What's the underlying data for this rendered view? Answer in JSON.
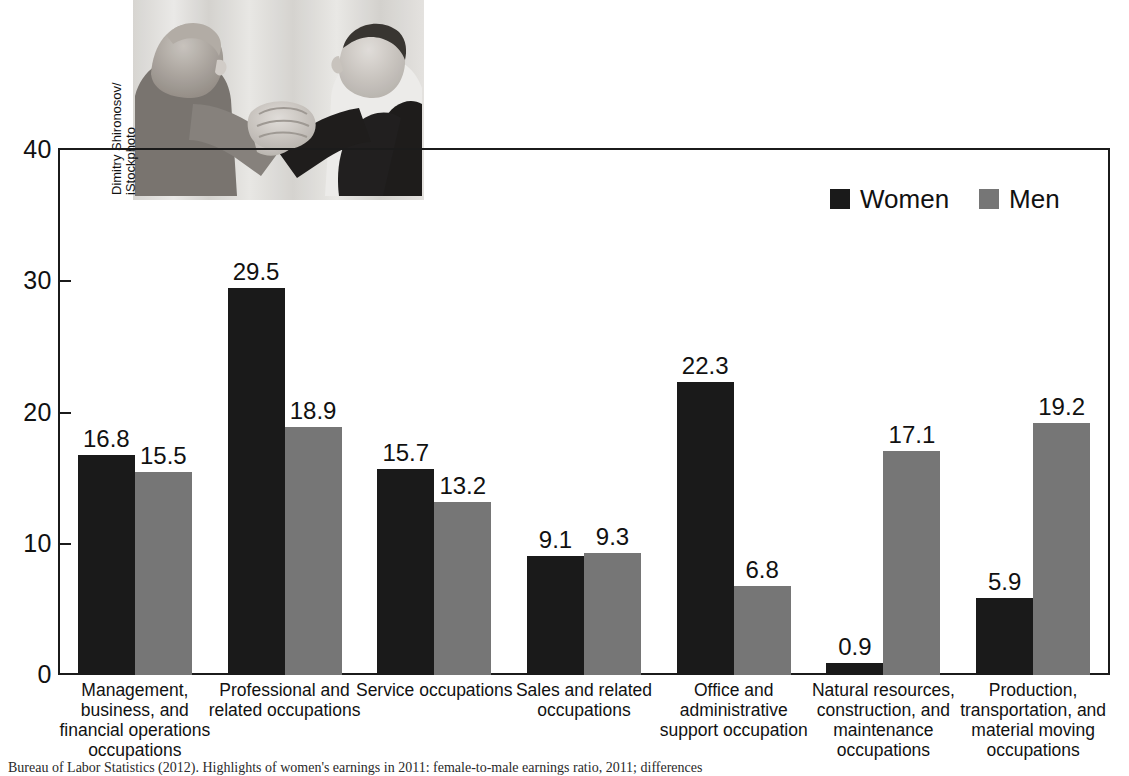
{
  "chart_data": {
    "type": "bar",
    "title": "",
    "subtitle": "",
    "xlabel": "",
    "ylabel": "",
    "ylim": [
      0,
      40
    ],
    "yticks": [
      "0",
      "10",
      "20",
      "30",
      "40"
    ],
    "grid": false,
    "legend_position": "top-right",
    "categories": [
      "Management, business, and financial operations occupations",
      "Professional and related occupations",
      "Service occupations",
      "Sales and related occupations",
      "Office and administrative support occupation",
      "Natural resources, construction, and maintenance occupations",
      "Production, transportation, and material moving occupations"
    ],
    "category_lines": [
      [
        "Management,",
        "business, and",
        "financial operations",
        "occupations"
      ],
      [
        "Professional and",
        "related occupations"
      ],
      [
        "Service occupations"
      ],
      [
        "Sales and related",
        "occupations"
      ],
      [
        "Office and",
        "administrative",
        "support occupation"
      ],
      [
        "Natural resources,",
        "construction, and",
        "maintenance",
        "occupations"
      ],
      [
        "Production,",
        "transportation, and",
        "material moving",
        "occupations"
      ]
    ],
    "series": [
      {
        "name": "Women",
        "color": "#1a1a1a",
        "values": [
          16.8,
          29.5,
          15.7,
          9.1,
          22.3,
          0.9,
          5.9
        ],
        "labels": [
          "16.8",
          "29.5",
          "15.7",
          "9.1",
          "22.3",
          "0.9",
          "5.9"
        ]
      },
      {
        "name": "Men",
        "color": "#767676",
        "values": [
          15.5,
          18.9,
          13.2,
          9.3,
          6.8,
          17.1,
          19.2
        ],
        "labels": [
          "15.5",
          "18.9",
          "13.2",
          "9.3",
          "6.8",
          "17.1",
          "19.2"
        ]
      }
    ]
  },
  "legend": {
    "items": [
      {
        "label": "Women",
        "color": "#1a1a1a"
      },
      {
        "label": "Men",
        "color": "#767676"
      }
    ]
  },
  "photo": {
    "alt": "arm-wrestling-photo",
    "credit": "Dimitry Shironosov/\niStockphoto"
  },
  "source": {
    "text": "Bureau of Labor Statistics (2012). Highlights of women's earnings in 2011: female-to-male earnings ratio, 2011; differences"
  }
}
